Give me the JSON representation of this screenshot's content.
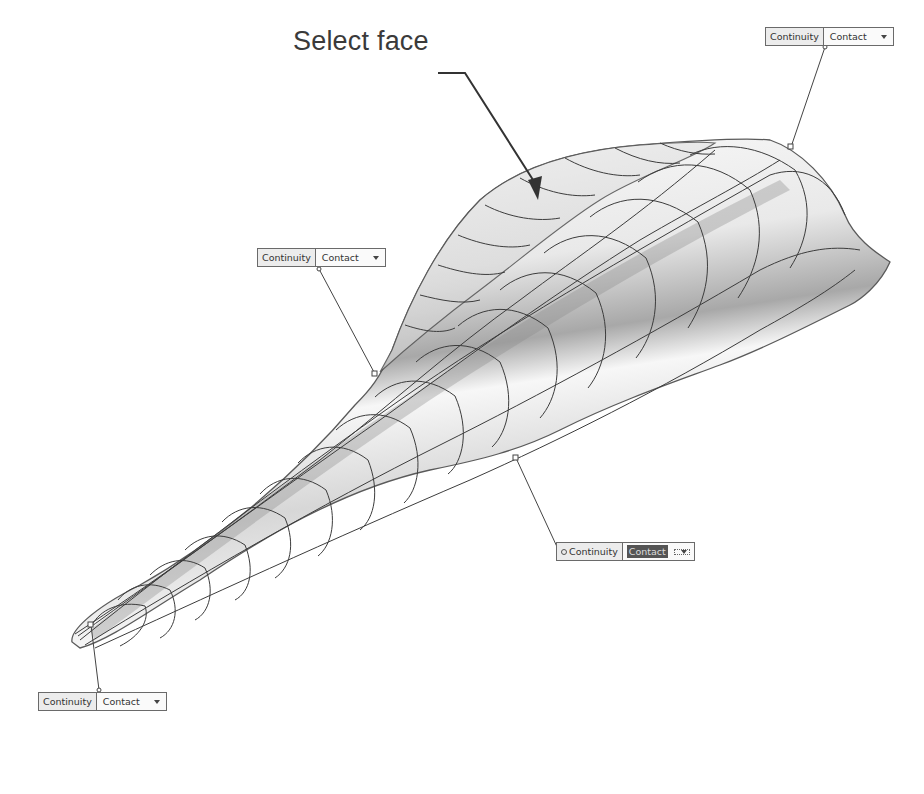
{
  "annotation": {
    "label": "Select face"
  },
  "callouts": [
    {
      "id": "top-right",
      "label": "Continuity",
      "value": "Contact",
      "selected": false
    },
    {
      "id": "mid-left",
      "label": "Continuity",
      "value": "Contact",
      "selected": false
    },
    {
      "id": "mid-bottom",
      "label": "Continuity",
      "value": "Contact",
      "selected": true
    },
    {
      "id": "bottom-left",
      "label": "Continuity",
      "value": "Contact",
      "selected": false
    }
  ],
  "colors": {
    "edge": "#5a5a5a",
    "grid": "#3c3c3c",
    "leader": "#444444",
    "background": "#ffffff"
  }
}
